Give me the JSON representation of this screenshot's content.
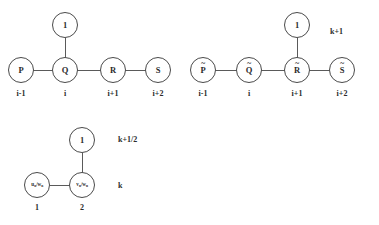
{
  "figure": {
    "background_color": "#ffffff",
    "stroke_color": "#4a4a4a",
    "text_color": "#2b2b2b"
  },
  "diagrams": [
    {
      "id": "upper-left-stencil",
      "nodes": [
        {
          "name": "node-one",
          "label": "1",
          "accent": "",
          "index": ""
        },
        {
          "name": "node-p",
          "label": "P",
          "accent": "",
          "index": "i-1"
        },
        {
          "name": "node-q",
          "label": "Q",
          "accent": "",
          "index": "i"
        },
        {
          "name": "node-r",
          "label": "R",
          "accent": "",
          "index": "i+1"
        },
        {
          "name": "node-s",
          "label": "S",
          "accent": "",
          "index": "i+2"
        }
      ],
      "time_labels": []
    },
    {
      "id": "upper-right-stencil",
      "nodes": [
        {
          "name": "node-one",
          "label": "1",
          "accent": "",
          "index": ""
        },
        {
          "name": "node-p-tilde",
          "label": "P",
          "accent": "~",
          "index": "i-1"
        },
        {
          "name": "node-q-tilde",
          "label": "Q",
          "accent": "~",
          "index": "i"
        },
        {
          "name": "node-r-tilde",
          "label": "R",
          "accent": "~",
          "index": "i+1"
        },
        {
          "name": "node-s-tilde",
          "label": "S",
          "accent": "~",
          "index": "i+2"
        }
      ],
      "time_labels": [
        {
          "name": "time-level-upper",
          "text": "k+1"
        },
        {
          "name": "time-level-lower",
          "text": "k+1/2"
        }
      ]
    },
    {
      "id": "lower-stencil",
      "nodes": [
        {
          "name": "node-one",
          "label": "1",
          "sub": "",
          "index": ""
        },
        {
          "name": "node-u-w",
          "label": "u",
          "sub": "n",
          "label2": "w",
          "sub2": "n",
          "index": "1"
        },
        {
          "name": "node-v-w",
          "label": "v",
          "sub": "n",
          "label2": "w",
          "sub2": "n",
          "index": "2"
        }
      ],
      "time_labels": [
        {
          "name": "time-level-upper",
          "text": "k+1/2"
        },
        {
          "name": "time-level-lower",
          "text": "k"
        }
      ]
    }
  ],
  "text": {
    "one": "1",
    "p": "P",
    "q": "Q",
    "r": "R",
    "s": "S",
    "idx_im1": "i-1",
    "idx_i": "i",
    "idx_ip1": "i+1",
    "idx_ip2": "i+2",
    "k_plus_1": "k+1",
    "k_plus_half": "k+1/2",
    "k": "k",
    "node1_num": "1",
    "node2_num": "2",
    "u": "u",
    "v": "v",
    "w": "w",
    "n": "n",
    "slash": "/"
  }
}
